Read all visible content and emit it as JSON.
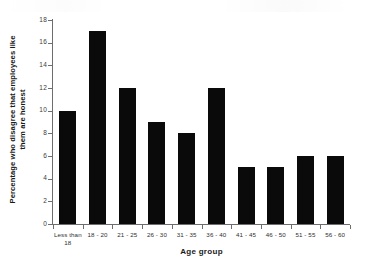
{
  "chart_data": {
    "type": "bar",
    "title": "",
    "xlabel": "Age group",
    "ylabel": "Percentage who disagree that employees like them are honest",
    "ylabel_line1": "Percentage who disagree that employees like",
    "ylabel_line2": "them are honest",
    "categories": [
      "Less than 18",
      "18 - 20",
      "21 - 25",
      "26 - 30",
      "31 - 35",
      "36 - 40",
      "41 - 45",
      "46 - 50",
      "51 - 55",
      "56 - 60"
    ],
    "category_lines": [
      [
        "Less than",
        "18"
      ],
      [
        "18 - 20",
        ""
      ],
      [
        "21 - 25",
        ""
      ],
      [
        "26 - 30",
        ""
      ],
      [
        "31 - 35",
        ""
      ],
      [
        "36 - 40",
        ""
      ],
      [
        "41 - 45",
        ""
      ],
      [
        "46 - 50",
        ""
      ],
      [
        "51 - 55",
        ""
      ],
      [
        "56 - 60",
        ""
      ]
    ],
    "values": [
      10,
      17,
      12,
      9,
      8,
      12,
      5,
      5,
      6,
      6
    ],
    "ylim": [
      0,
      18
    ],
    "yticks": [
      0,
      2,
      4,
      6,
      8,
      10,
      12,
      14,
      16,
      18
    ],
    "ytick_labels": [
      "0",
      "2",
      "4",
      "6",
      "8",
      "10",
      "12",
      "14",
      "16",
      "18"
    ],
    "grid": false,
    "legend": false,
    "bar_color": "#0a0a0a",
    "axis_color": "#6e6e6e",
    "background": "#ffffff"
  }
}
